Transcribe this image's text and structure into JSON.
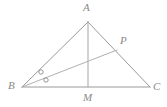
{
  "figure": {
    "kind": "euclidean-geometry-diagram",
    "background_color": "#ffffff",
    "stroke_color": "#9a9a9a",
    "label_color": "#8a8a8a",
    "mark_color": "#8a8a8a",
    "width": 167,
    "height": 107
  },
  "labels": {
    "apex": "A",
    "left": "B",
    "right": "C",
    "on_side_ac": "P",
    "on_base": "M"
  },
  "points": {
    "A": {
      "x": 88,
      "y": 22
    },
    "B": {
      "x": 22,
      "y": 87
    },
    "C": {
      "x": 150,
      "y": 87
    },
    "M": {
      "x": 88,
      "y": 87
    },
    "P": {
      "x": 117,
      "y": 50
    }
  },
  "segments": [
    {
      "name": "AB",
      "from": "A",
      "to": "B"
    },
    {
      "name": "AC",
      "from": "A",
      "to": "C"
    },
    {
      "name": "BC",
      "from": "B",
      "to": "C"
    },
    {
      "name": "AM",
      "from": "A",
      "to": "M"
    },
    {
      "name": "BP",
      "from": "B",
      "to": "P"
    }
  ],
  "angle_marks": {
    "vertex": "B",
    "style": "small-open-circle",
    "count": 2,
    "meaning": "equal angles",
    "circles": [
      {
        "cx": 41,
        "cy": 72,
        "r": 2.2
      },
      {
        "cx": 46,
        "cy": 80,
        "r": 2.2
      }
    ]
  }
}
